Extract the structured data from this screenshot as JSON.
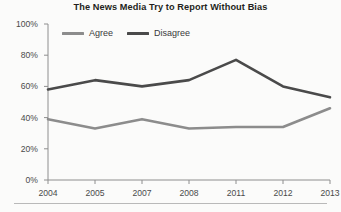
{
  "chart_data": {
    "type": "line",
    "title": "The News Media Try to Report Without Bias",
    "xlabel": "",
    "ylabel": "",
    "categories": [
      "2004",
      "2005",
      "2007",
      "2008",
      "2011",
      "2012",
      "2013"
    ],
    "series": [
      {
        "name": "Agree",
        "values": [
          39,
          33,
          39,
          33,
          34,
          34,
          46
        ],
        "color": "#8c8c8c"
      },
      {
        "name": "Disagree",
        "values": [
          58,
          64,
          60,
          64,
          77,
          60,
          53
        ],
        "color": "#4a4a4a"
      }
    ],
    "ylim": [
      0,
      100
    ],
    "yticks": [
      0,
      20,
      40,
      60,
      80,
      100
    ],
    "ytick_labels": [
      "0%",
      "20%",
      "40%",
      "60%",
      "80%",
      "100%"
    ],
    "grid": false,
    "legend_position": "top-left",
    "value_suffix": "%"
  },
  "legend": {
    "agree_label": "Agree",
    "disagree_label": "Disagree"
  },
  "axis": {
    "y_title": "",
    "x_title": ""
  },
  "colors": {
    "agree": "#8c8c8c",
    "disagree": "#4a4a4a",
    "axis": "#8e8e8e",
    "text": "#4a4a4a",
    "title": "#231f20",
    "background": "#fbfbfa"
  }
}
